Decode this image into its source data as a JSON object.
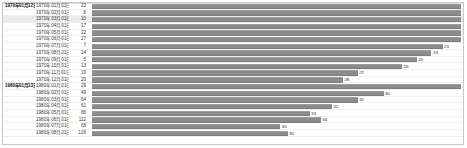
{
  "chart_data": {
    "type": "bar",
    "title": "",
    "xlabel": "",
    "ylabel": "",
    "grid": true,
    "legend": "none",
    "orientation": "horizontal",
    "bar_color": "#8c8c8c",
    "highlight_color": "#ebebeb",
    "xlim": [
      0,
      36
    ],
    "columns": [
      "group",
      "label",
      "value",
      "bar"
    ],
    "groups": [
      "1970年01月12日",
      "1980年01月13日"
    ],
    "categories": [
      "1970年01月",
      "1970年02月",
      "1970年03月",
      "1970年04月",
      "1970年05月",
      "1970年06月",
      "1970年07月",
      "1970年08月",
      "1970年09月",
      "1970年10月",
      "1970年11月",
      "1970年12月",
      "1980年01月",
      "1980年02月",
      "1980年03月",
      "1980年04月",
      "1980年05月",
      "1980年06月",
      "1980年07月",
      "1980年08月"
    ],
    "values": [
      23,
      8,
      10,
      17,
      22,
      27,
      7,
      14,
      5,
      13,
      19,
      20,
      29,
      49,
      64,
      61,
      86,
      112,
      68,
      126
    ],
    "bar_labels": [
      17,
      18,
      19,
      20,
      21,
      22,
      23,
      24,
      25,
      26,
      27,
      28,
      29,
      30,
      31,
      32,
      33,
      34,
      35,
      36
    ],
    "bar_lengths": [
      100,
      100,
      100,
      100,
      100,
      100,
      95,
      92,
      88,
      84,
      72,
      68,
      100,
      79,
      72,
      65,
      59,
      62,
      51,
      53
    ]
  },
  "rows": [
    {
      "group": "1970年01月12日",
      "label": "1970年01月01日",
      "value": "23",
      "bar_label": "17",
      "bar_len": 100,
      "shade": false
    },
    {
      "group": "",
      "label": "1970年02月01日",
      "value": "8",
      "bar_label": "18",
      "bar_len": 100,
      "shade": false
    },
    {
      "group": "",
      "label": "1970年03月01日",
      "value": "10",
      "bar_label": "19",
      "bar_len": 100,
      "shade": true
    },
    {
      "group": "",
      "label": "1970年04月01日",
      "value": "17",
      "bar_label": "20",
      "bar_len": 100,
      "shade": false
    },
    {
      "group": "",
      "label": "1970年05月01日",
      "value": "22",
      "bar_label": "21",
      "bar_len": 100,
      "shade": false
    },
    {
      "group": "",
      "label": "1970年06月01日",
      "value": "27",
      "bar_label": "22",
      "bar_len": 100,
      "shade": false
    },
    {
      "group": "",
      "label": "1970年07月01日",
      "value": "7",
      "bar_label": "23",
      "bar_len": 95,
      "shade": false
    },
    {
      "group": "",
      "label": "1970年08月01日",
      "value": "14",
      "bar_label": "24",
      "bar_len": 92,
      "shade": false
    },
    {
      "group": "",
      "label": "1970年09月01日",
      "value": "5",
      "bar_label": "25",
      "bar_len": 88,
      "shade": false
    },
    {
      "group": "",
      "label": "1970年10月01日",
      "value": "13",
      "bar_label": "26",
      "bar_len": 84,
      "shade": false
    },
    {
      "group": "",
      "label": "1970年11月01日",
      "value": "19",
      "bar_label": "27",
      "bar_len": 72,
      "shade": false
    },
    {
      "group": "",
      "label": "1970年12月01日",
      "value": "20",
      "bar_label": "28",
      "bar_len": 68,
      "shade": false
    },
    {
      "group": "1980年01月13日",
      "label": "1980年01月01日",
      "value": "29",
      "bar_label": "29",
      "bar_len": 100,
      "shade": false
    },
    {
      "group": "",
      "label": "1980年02月01日",
      "value": "49",
      "bar_label": "30",
      "bar_len": 79,
      "shade": false
    },
    {
      "group": "",
      "label": "1980年03月01日",
      "value": "64",
      "bar_label": "31",
      "bar_len": 72,
      "shade": false
    },
    {
      "group": "",
      "label": "1980年04月01日",
      "value": "61",
      "bar_label": "32",
      "bar_len": 65,
      "shade": false
    },
    {
      "group": "",
      "label": "1980年05月01日",
      "value": "86",
      "bar_label": "33",
      "bar_len": 59,
      "shade": false
    },
    {
      "group": "",
      "label": "1980年06月01日",
      "value": "112",
      "bar_label": "34",
      "bar_len": 62,
      "shade": false
    },
    {
      "group": "",
      "label": "1980年07月01日",
      "value": "68",
      "bar_label": "35",
      "bar_len": 51,
      "shade": false
    },
    {
      "group": "",
      "label": "1980年08月01日",
      "value": "126",
      "bar_label": "36",
      "bar_len": 53,
      "shade": false
    }
  ]
}
